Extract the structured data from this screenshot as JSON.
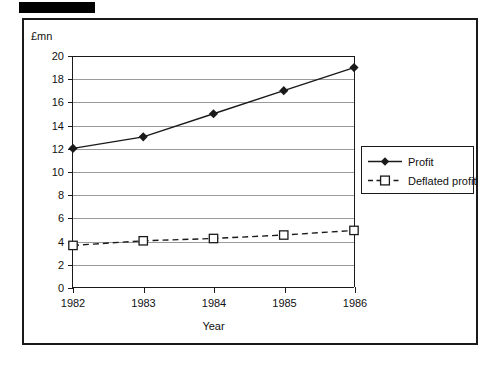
{
  "redaction": {
    "name": "redacted-title-bar"
  },
  "chart_data": {
    "type": "line",
    "title": "",
    "xlabel": "Year",
    "ylabel": "£mn",
    "y_unit_label": "£mn",
    "categories": [
      "1982",
      "1983",
      "1984",
      "1985",
      "1986"
    ],
    "x": [
      1982,
      1983,
      1984,
      1985,
      1986
    ],
    "ylim": [
      0,
      20
    ],
    "yticks": [
      "0",
      "2",
      "4",
      "6",
      "8",
      "10",
      "12",
      "14",
      "16",
      "18",
      "20"
    ],
    "ytick_values": [
      0,
      2,
      4,
      6,
      8,
      10,
      12,
      14,
      16,
      18,
      20
    ],
    "grid": true,
    "legend_position": "lower right",
    "series": [
      {
        "name": "Profit",
        "values": [
          12,
          13,
          15,
          17,
          19
        ],
        "line_style": "solid",
        "marker": "filled-diamond",
        "color": "#1a1a1a"
      },
      {
        "name": "Deflated profit",
        "values": [
          3.6,
          4.0,
          4.2,
          4.5,
          4.9
        ],
        "line_style": "dashed",
        "marker": "open-square",
        "color": "#1a1a1a"
      }
    ]
  },
  "legend": {
    "entries": [
      {
        "label": "Profit"
      },
      {
        "label": "Deflated profit"
      }
    ]
  },
  "colors": {
    "frame": "#1a1a1a",
    "gridline": "#9a9a9a",
    "plot_background": "#ffffff",
    "redaction": "#000000"
  }
}
